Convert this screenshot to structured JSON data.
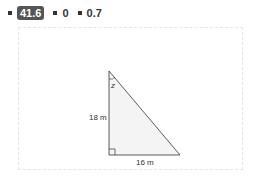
{
  "legend": {
    "items": [
      {
        "value": "41.6",
        "highlighted": true
      },
      {
        "value": "0",
        "highlighted": false
      },
      {
        "value": "0.7",
        "highlighted": false
      }
    ]
  },
  "diagram": {
    "type": "right-triangle",
    "angle_label": "z",
    "vertical_side_label": "18 m",
    "horizontal_side_label": "16 m",
    "fill_color": "#f4f4f4",
    "stroke_color": "#333333"
  }
}
